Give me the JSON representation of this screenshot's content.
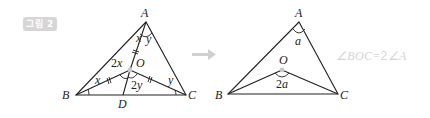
{
  "figure": {
    "badge_label": "그림 2"
  },
  "left_diagram": {
    "vertices": {
      "A": "A",
      "B": "B",
      "C": "C",
      "O": "O",
      "D": "D"
    },
    "angle_labels": {
      "x_at_A": "x",
      "y_at_A": "y",
      "x_at_B": "x",
      "y_at_C": "y",
      "two_x_coef": "2",
      "two_x_var": "x",
      "two_y_coef": "2",
      "two_y_var": "y"
    }
  },
  "arrow": {
    "direction": "right",
    "color": "#d0d0d0"
  },
  "right_diagram": {
    "vertices": {
      "A": "A",
      "B": "B",
      "C": "C",
      "O": "O"
    },
    "angle_labels": {
      "a_at_A": "a",
      "two_a_coef": "2",
      "two_a_var": "a"
    }
  },
  "formula": {
    "prefix": "∠BOC=",
    "coef": "2",
    "suffix": "∠A"
  },
  "colors": {
    "line": "#222222",
    "badge_bg": "#d6d6d6",
    "formula": "#d4d4d4",
    "center_dot": "#c8c8c8"
  }
}
